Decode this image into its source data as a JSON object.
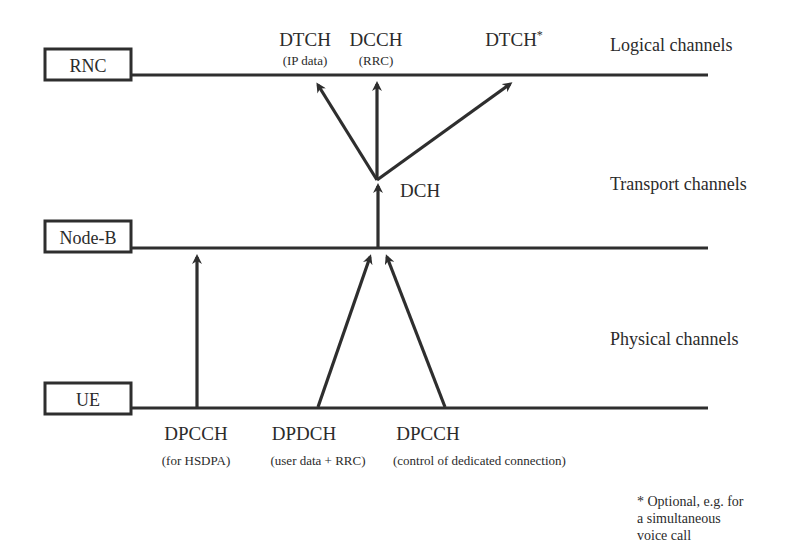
{
  "diagram": {
    "colors": {
      "ink": "#2e2e2e",
      "text": "#2b2b2b",
      "background": "#ffffff"
    },
    "nodes": [
      {
        "id": "rnc",
        "label": "RNC",
        "y": 75
      },
      {
        "id": "nodeb",
        "label": "Node-B",
        "y": 248
      },
      {
        "id": "ue",
        "label": "UE",
        "y": 408
      }
    ],
    "layers": [
      {
        "id": "logical",
        "label": "Logical channels"
      },
      {
        "id": "transport",
        "label": "Transport channels"
      },
      {
        "id": "physical",
        "label": "Physical channels"
      }
    ],
    "logical_channels": [
      {
        "id": "dtch-ip",
        "name": "DTCH",
        "note": "(IP data)"
      },
      {
        "id": "dcch",
        "name": "DCCH",
        "note": "(RRC)"
      },
      {
        "id": "dtch-opt",
        "name": "DTCH",
        "superscript": "*"
      }
    ],
    "transport_channels": [
      {
        "id": "dch",
        "name": "DCH"
      }
    ],
    "physical_channels": [
      {
        "id": "dpcch-hsdpa",
        "name": "DPCCH",
        "note": "(for HSDPA)"
      },
      {
        "id": "dpdch",
        "name": "DPDCH",
        "note": "(user data + RRC)"
      },
      {
        "id": "dpcch-ctrl",
        "name": "DPCCH",
        "note": "(control of dedicated connection)"
      }
    ],
    "footnote": {
      "lines": [
        "* Optional, e.g. for",
        "a simultaneous",
        "voice call"
      ]
    }
  }
}
